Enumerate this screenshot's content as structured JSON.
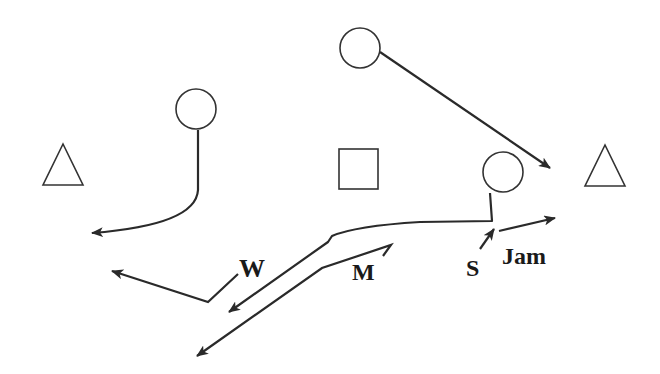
{
  "diagram": {
    "type": "football-play-diagram",
    "colors": {
      "stroke": "#2a2a2a",
      "text": "#1a1a1a",
      "background": "#ffffff"
    },
    "players": [
      {
        "id": "left-triangle",
        "shape": "triangle",
        "cx": 63,
        "cy": 168
      },
      {
        "id": "right-triangle",
        "shape": "triangle",
        "cx": 605,
        "cy": 168
      },
      {
        "id": "left-circle",
        "shape": "circle",
        "cx": 196,
        "cy": 109
      },
      {
        "id": "top-circle",
        "shape": "circle",
        "cx": 360,
        "cy": 48
      },
      {
        "id": "right-circle",
        "shape": "circle",
        "cx": 503,
        "cy": 172
      },
      {
        "id": "center-square",
        "shape": "square",
        "cx": 358,
        "cy": 169
      }
    ],
    "labels": {
      "w": "W",
      "m": "M",
      "s": "S",
      "jam": "Jam"
    }
  }
}
